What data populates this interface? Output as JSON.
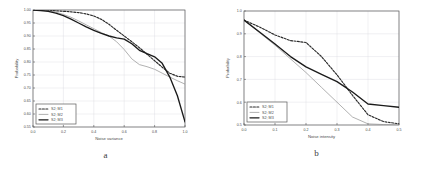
{
  "figure": {
    "panels": [
      {
        "id": "a",
        "sublabel": "a",
        "xlabel": "Noise variance",
        "ylabel": "Probability"
      },
      {
        "id": "b",
        "sublabel": "b",
        "xlabel": "Noise intensity",
        "ylabel": "Probability"
      }
    ]
  },
  "legend": {
    "entries": [
      {
        "label": "S2; M1",
        "style": "dashed"
      },
      {
        "label": "S2; M2",
        "style": "thin-solid"
      },
      {
        "label": "S2; M3",
        "style": "thick-solid"
      }
    ]
  },
  "colors": {
    "axis": "#5a5a5a",
    "grid": "#d8d8e0",
    "series_m1": "#2b2b2b",
    "series_m2": "#8f8f8f",
    "series_m3": "#1a1a1a",
    "background": "#ffffff",
    "text": "#4a4a4a"
  },
  "chart_data": [
    {
      "type": "line",
      "title": "",
      "subfigure": "a",
      "xlabel": "Noise variance",
      "ylabel": "Probability",
      "xlim": [
        0.0,
        1.0
      ],
      "ylim": [
        0.55,
        1.0
      ],
      "xticks": [
        0.0,
        0.2,
        0.4,
        0.6,
        0.8,
        1.0
      ],
      "xticklabels": [
        "0.0",
        "0.2",
        "0.4",
        "0.6",
        "0.8",
        "1.0"
      ],
      "yticks": [
        0.55,
        0.6,
        0.65,
        0.7,
        0.75,
        0.8,
        0.85,
        0.9,
        0.95,
        1.0
      ],
      "yticklabels": [
        "0.55",
        "0.60",
        "0.65",
        "0.70",
        "0.75",
        "0.80",
        "0.85",
        "0.90",
        "0.95",
        "1.00"
      ],
      "grid": true,
      "legend_position": "lower left",
      "series": [
        {
          "name": "S2; M1",
          "style": "dashed",
          "x": [
            0.0,
            0.05,
            0.1,
            0.15,
            0.2,
            0.25,
            0.3,
            0.35,
            0.4,
            0.45,
            0.5,
            0.55,
            0.6,
            0.65,
            0.7,
            0.75,
            0.8,
            0.85,
            0.9,
            0.95,
            1.0
          ],
          "y": [
            1.0,
            0.999,
            0.998,
            0.997,
            0.995,
            0.993,
            0.99,
            0.985,
            0.977,
            0.964,
            0.945,
            0.922,
            0.9,
            0.878,
            0.855,
            0.83,
            0.805,
            0.78,
            0.757,
            0.745,
            0.742
          ]
        },
        {
          "name": "S2; M2",
          "style": "thin-solid",
          "x": [
            0.0,
            0.05,
            0.1,
            0.15,
            0.2,
            0.25,
            0.3,
            0.35,
            0.4,
            0.45,
            0.5,
            0.55,
            0.6,
            0.65,
            0.7,
            0.75,
            0.8,
            0.85,
            0.9,
            0.95,
            1.0
          ],
          "y": [
            1.0,
            0.999,
            0.997,
            0.992,
            0.983,
            0.972,
            0.958,
            0.943,
            0.928,
            0.913,
            0.9,
            0.878,
            0.848,
            0.812,
            0.79,
            0.782,
            0.772,
            0.757,
            0.742,
            0.728,
            0.715
          ]
        },
        {
          "name": "S2; M3",
          "style": "thick-solid",
          "x": [
            0.0,
            0.05,
            0.1,
            0.15,
            0.2,
            0.25,
            0.3,
            0.35,
            0.4,
            0.45,
            0.5,
            0.55,
            0.6,
            0.65,
            0.7,
            0.75,
            0.8,
            0.85,
            0.9,
            0.95,
            1.0
          ],
          "y": [
            1.0,
            0.998,
            0.995,
            0.988,
            0.978,
            0.965,
            0.95,
            0.935,
            0.922,
            0.91,
            0.9,
            0.893,
            0.888,
            0.87,
            0.845,
            0.832,
            0.82,
            0.795,
            0.742,
            0.67,
            0.57
          ]
        }
      ]
    },
    {
      "type": "line",
      "title": "",
      "subfigure": "b",
      "xlabel": "Noise intensity",
      "ylabel": "Probability",
      "xlim": [
        0.0,
        0.5
      ],
      "ylim": [
        0.5,
        1.0
      ],
      "xticks": [
        0.0,
        0.1,
        0.2,
        0.3,
        0.4,
        0.5
      ],
      "xticklabels": [
        "0.0",
        "0.1",
        "0.2",
        "0.3",
        "0.4",
        "0.5"
      ],
      "yticks": [
        0.5,
        0.6,
        0.7,
        0.8,
        0.9,
        1.0
      ],
      "yticklabels": [
        "0.5",
        "0.6",
        "0.7",
        "0.8",
        "0.9",
        "1.0"
      ],
      "grid": true,
      "legend_position": "lower left",
      "series": [
        {
          "name": "S2; M1",
          "style": "dashed",
          "x": [
            0.0,
            0.05,
            0.1,
            0.15,
            0.2,
            0.25,
            0.3,
            0.35,
            0.4,
            0.45,
            0.5
          ],
          "y": [
            0.96,
            0.93,
            0.895,
            0.87,
            0.862,
            0.8,
            0.72,
            0.63,
            0.545,
            0.515,
            0.505
          ]
        },
        {
          "name": "S2; M2",
          "style": "thin-solid",
          "x": [
            0.0,
            0.05,
            0.1,
            0.15,
            0.2,
            0.25,
            0.3,
            0.35,
            0.4,
            0.45,
            0.5
          ],
          "y": [
            0.96,
            0.905,
            0.85,
            0.79,
            0.73,
            0.665,
            0.6,
            0.535,
            0.505,
            0.502,
            0.5
          ]
        },
        {
          "name": "S2; M3",
          "style": "thick-solid",
          "x": [
            0.0,
            0.05,
            0.1,
            0.15,
            0.2,
            0.25,
            0.3,
            0.35,
            0.4,
            0.45,
            0.5
          ],
          "y": [
            0.96,
            0.908,
            0.855,
            0.8,
            0.755,
            0.722,
            0.69,
            0.645,
            0.592,
            0.585,
            0.578
          ]
        }
      ]
    }
  ]
}
